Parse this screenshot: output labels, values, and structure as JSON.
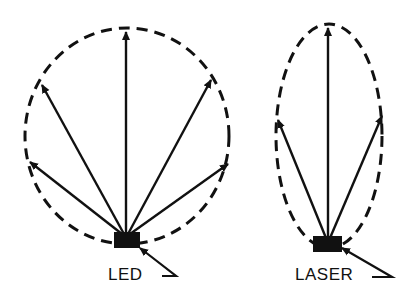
{
  "diagram": {
    "type": "emission-pattern-comparison",
    "panels": [
      {
        "id": "led",
        "label": "LED",
        "pattern": "wide (near-circular) dashed envelope",
        "ray_count": 5
      },
      {
        "id": "laser",
        "label": "LASER",
        "pattern": "narrow (elongated ellipse) dashed envelope",
        "ray_count": 3
      }
    ],
    "colors": {
      "ink": "#111111",
      "background": "#ffffff"
    }
  }
}
